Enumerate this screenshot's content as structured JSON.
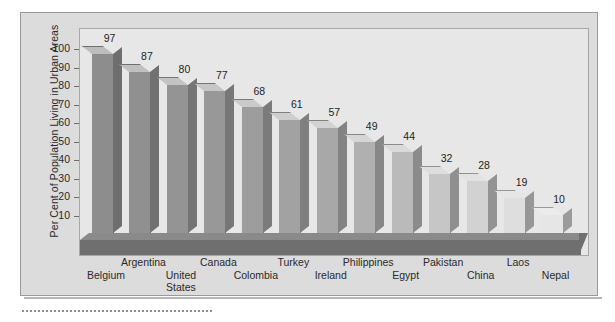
{
  "chart_data": {
    "type": "bar",
    "title": "",
    "subtitle": "",
    "xlabel": "",
    "ylabel": "Per Cent of Population Living in Urban Areas",
    "ylim": [
      0,
      105
    ],
    "yticks": [
      10,
      20,
      30,
      40,
      50,
      60,
      70,
      80,
      90,
      100
    ],
    "grid": false,
    "legend": null,
    "style": "3d-column",
    "categories": [
      "Belgium",
      "Argentina",
      "United\nStates",
      "Canada",
      "Colombia",
      "Turkey",
      "Ireland",
      "Philippines",
      "Egypt",
      "Pakistan",
      "China",
      "Laos",
      "Nepal"
    ],
    "values": [
      97,
      87,
      80,
      77,
      68,
      61,
      57,
      49,
      44,
      32,
      28,
      19,
      10
    ],
    "value_labels": [
      "97",
      "87",
      "80",
      "77",
      "68",
      "61",
      "57",
      "49",
      "44",
      "32",
      "28",
      "19",
      "10"
    ],
    "category_rows": [
      1,
      0,
      1,
      0,
      1,
      0,
      1,
      0,
      1,
      0,
      1,
      0,
      1
    ]
  },
  "colors": {
    "panel_background": "#dcdcdc",
    "plot_background": "#e7e7e7",
    "panel_border": "#9a9a9a",
    "plot_border": "#a8a8a8",
    "floor": "#6f6f6f",
    "floor_top": "#8a8a8a",
    "text": "#2a2a2a",
    "tick": "#6e6e6e",
    "dotted_rule": "#8e8e8e"
  },
  "bar_colors": [
    {
      "front": "#8d8d8d",
      "side": "#6e6e6e",
      "top": "#bdbdbd"
    },
    {
      "front": "#909090",
      "side": "#717171",
      "top": "#c0c0c0"
    },
    {
      "front": "#949494",
      "side": "#747474",
      "top": "#c3c3c3"
    },
    {
      "front": "#989898",
      "side": "#777777",
      "top": "#c6c6c6"
    },
    {
      "front": "#9d9d9d",
      "side": "#7b7b7b",
      "top": "#cacaca"
    },
    {
      "front": "#a2a2a2",
      "side": "#7f7f7f",
      "top": "#cecece"
    },
    {
      "front": "#a8a8a8",
      "side": "#838383",
      "top": "#d2d2d2"
    },
    {
      "front": "#b0b0b0",
      "side": "#878787",
      "top": "#d6d6d6"
    },
    {
      "front": "#bababa",
      "side": "#8b8b8b",
      "top": "#dadada"
    },
    {
      "front": "#c6c6c6",
      "side": "#8f8f8f",
      "top": "#dedede"
    },
    {
      "front": "#d2d2d2",
      "side": "#939393",
      "top": "#e2e2e2"
    },
    {
      "front": "#dedede",
      "side": "#979797",
      "top": "#e6e6e6"
    },
    {
      "front": "#e6e6e6",
      "side": "#9b9b9b",
      "top": "#ebebeb"
    }
  ]
}
